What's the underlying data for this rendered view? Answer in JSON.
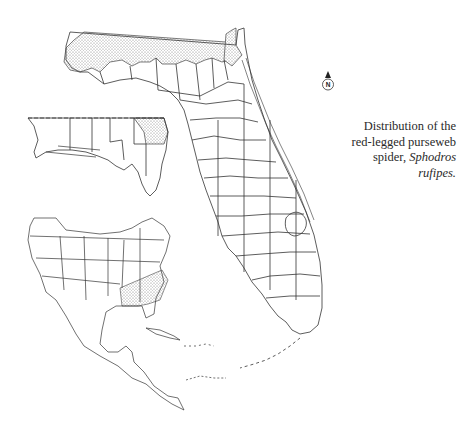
{
  "figure": {
    "caption": {
      "line1": "Distribution of the",
      "line2": "red-legged purseweb",
      "line3_prefix": "spider, ",
      "line3_italic": "Sphodros",
      "line4_italic": "rufipes."
    },
    "north_arrow": {
      "label": "N",
      "icon": "north-arrow-icon"
    },
    "maps": [
      {
        "name": "florida-counties",
        "shaded_region": "northern Florida border counties (panhandle & northeast)"
      },
      {
        "name": "florida-panhandle-inset",
        "shaded_region": "easternmost panhandle counties"
      },
      {
        "name": "north-america-inset",
        "shaded_region": "southeastern United States"
      }
    ],
    "colors": {
      "line": "#333333",
      "stipple": "#888888",
      "background": "#ffffff"
    }
  }
}
